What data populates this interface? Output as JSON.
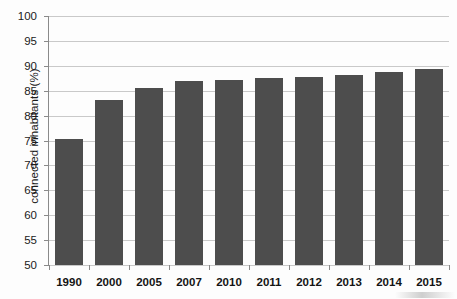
{
  "chart_data": {
    "type": "bar",
    "title": "",
    "subtitle": "",
    "xlabel": "",
    "ylabel": "connected inhabitants (%)",
    "categories": [
      "1990",
      "2000",
      "2005",
      "2007",
      "2010",
      "2011",
      "2012",
      "2013",
      "2014",
      "2015"
    ],
    "values": [
      75.4,
      83.1,
      85.6,
      86.9,
      87.1,
      87.5,
      87.8,
      88.2,
      88.7,
      89.4
    ],
    "ylim": [
      50,
      100
    ],
    "ytick_labels": [
      "100",
      "95",
      "90",
      "85",
      "80",
      "75",
      "70",
      "65",
      "60",
      "55",
      "50"
    ],
    "ytick_values": [
      100,
      95,
      90,
      85,
      80,
      75,
      70,
      65,
      60,
      55,
      50
    ],
    "ytick_step": 5,
    "grid": true,
    "grid_axis": "y",
    "legend": null,
    "legend_position": "none",
    "series": [
      {
        "name": "connected inhabitants",
        "values": [
          75.4,
          83.1,
          85.6,
          86.9,
          87.1,
          87.5,
          87.8,
          88.2,
          88.7,
          89.4
        ]
      }
    ],
    "bar_color": "#4d4d4d",
    "grid_color": "#c9c9c9",
    "axis_color": "#8a8a8a",
    "background_color": "#fdfdfd"
  }
}
